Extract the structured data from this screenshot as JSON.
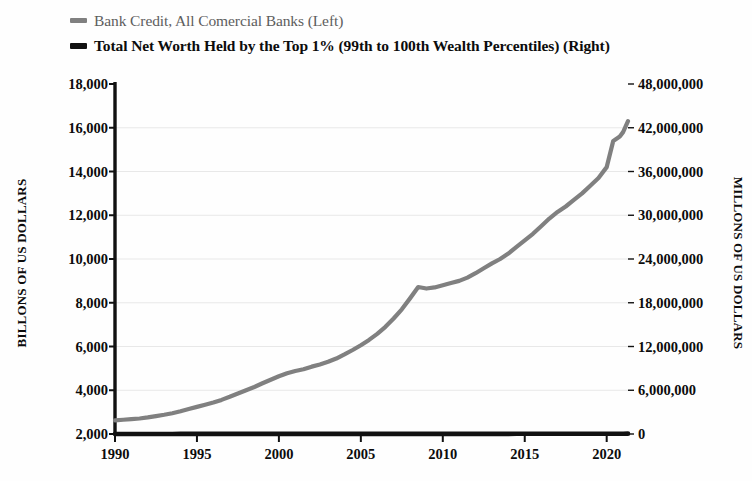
{
  "legend": {
    "position": "top-left",
    "entries": [
      {
        "label": "Bank Credit, All Comercial Banks (Left)",
        "color": "#808080",
        "style": "gray"
      },
      {
        "label": "Total Net Worth Held by the Top 1% (99th to 100th Wealth Percentiles) (Right)",
        "color": "#111111",
        "style": "black"
      }
    ]
  },
  "axes": {
    "left_title": "BILLONS OF US DOLLARS",
    "right_title": "MILLONS OF US DOLLARS",
    "left_ticks": [
      "18,000",
      "16,000",
      "14,000",
      "12,000",
      "10,000",
      "8,000",
      "6,000",
      "4,000",
      "2,000"
    ],
    "right_ticks": [
      "48,000,000",
      "42,000,000",
      "36,000,000",
      "30,000,000",
      "24,000,000",
      "18,000,000",
      "12,000,000",
      "6,000,000",
      "0"
    ],
    "x_ticks": [
      "1990",
      "1995",
      "2000",
      "2005",
      "2010",
      "2015",
      "2020"
    ]
  },
  "chart_data": {
    "type": "line",
    "title": "",
    "xlabel": "",
    "ylabel": "BILLONS OF US DOLLARS",
    "y2label": "MILLONS OF US DOLLARS",
    "grid": true,
    "xlim": [
      1990,
      2021.3
    ],
    "ylim": [
      2000,
      18000
    ],
    "y2lim": [
      0,
      48000000
    ],
    "series": [
      {
        "name": "Bank Credit, All Comercial Banks (Left)",
        "axis": "left",
        "color": "#808080",
        "units": "Billions of US Dollars",
        "x": [
          1990,
          1990.5,
          1991,
          1991.5,
          1992,
          1992.5,
          1993,
          1993.5,
          1994,
          1994.5,
          1995,
          1995.5,
          1996,
          1996.5,
          1997,
          1997.5,
          1998,
          1998.5,
          1999,
          1999.5,
          2000,
          2000.5,
          2001,
          2001.5,
          2002,
          2002.5,
          2003,
          2003.5,
          2004,
          2004.5,
          2005,
          2005.5,
          2006,
          2006.5,
          2007,
          2007.5,
          2008,
          2008.5,
          2009,
          2009.5,
          2010,
          2010.5,
          2011,
          2011.5,
          2012,
          2012.5,
          2013,
          2013.5,
          2014,
          2014.5,
          2015,
          2015.5,
          2016,
          2016.5,
          2017,
          2017.5,
          2018,
          2018.5,
          2019,
          2019.5,
          2020,
          2020.4,
          2020.8,
          2021,
          2021.3
        ],
        "y": [
          2620,
          2650,
          2680,
          2710,
          2760,
          2820,
          2880,
          2950,
          3040,
          3140,
          3240,
          3340,
          3440,
          3560,
          3700,
          3850,
          4000,
          4150,
          4320,
          4480,
          4640,
          4780,
          4880,
          4960,
          5080,
          5180,
          5300,
          5450,
          5640,
          5840,
          6060,
          6300,
          6580,
          6900,
          7280,
          7700,
          8200,
          8720,
          8650,
          8700,
          8800,
          8900,
          9000,
          9150,
          9350,
          9580,
          9800,
          10000,
          10250,
          10550,
          10850,
          11150,
          11500,
          11850,
          12150,
          12400,
          12700,
          13000,
          13350,
          13700,
          14200,
          15400,
          15600,
          15800,
          16300
        ]
      },
      {
        "name": "Total Net Worth Held by the Top 1% (99th to 100th Wealth Percentiles) (Right)",
        "axis": "right",
        "color": "#111111",
        "units": "Millions of US Dollars",
        "x": [
          1990,
          1990.5,
          1991,
          1991.5,
          1992,
          1992.5,
          1993,
          1993.5,
          1994,
          1994.5,
          1995,
          1995.5,
          1996,
          1996.5,
          1997,
          1997.5,
          1998,
          1998.5,
          1999,
          1999.5,
          2000,
          2000.5,
          2001,
          2001.5,
          2002,
          2002.5,
          2003,
          2003.5,
          2004,
          2004.5,
          2005,
          2005.5,
          2006,
          2006.5,
          2007,
          2007.5,
          2008,
          2008.5,
          2009,
          2009.5,
          2010,
          2010.5,
          2011,
          2011.5,
          2012,
          2012.5,
          2013,
          2013.5,
          2014,
          2014.5,
          2015,
          2015.5,
          2016,
          2016.5,
          2017,
          2017.5,
          2018,
          2018.5,
          2019,
          2019.5,
          2020,
          2020.3,
          2020.6,
          2021,
          2021.3
        ],
        "y": [
          8400,
          8500,
          8700,
          8900,
          9200,
          9500,
          9800,
          10100,
          10400,
          10700,
          11200,
          11700,
          12300,
          12900,
          13500,
          14200,
          14800,
          15400,
          15900,
          16200,
          16300,
          16100,
          15700,
          15500,
          15400,
          15500,
          15600,
          16200,
          16900,
          17500,
          18100,
          18800,
          19600,
          20400,
          21000,
          21500,
          21200,
          19200,
          16500,
          17000,
          17900,
          18400,
          19000,
          19300,
          20100,
          21000,
          22000,
          22700,
          23700,
          24600,
          25100,
          25000,
          26000,
          27000,
          28500,
          29800,
          31300,
          30200,
          32500,
          34500,
          36500,
          33500,
          38500,
          42500,
          45500
        ]
      }
    ]
  }
}
